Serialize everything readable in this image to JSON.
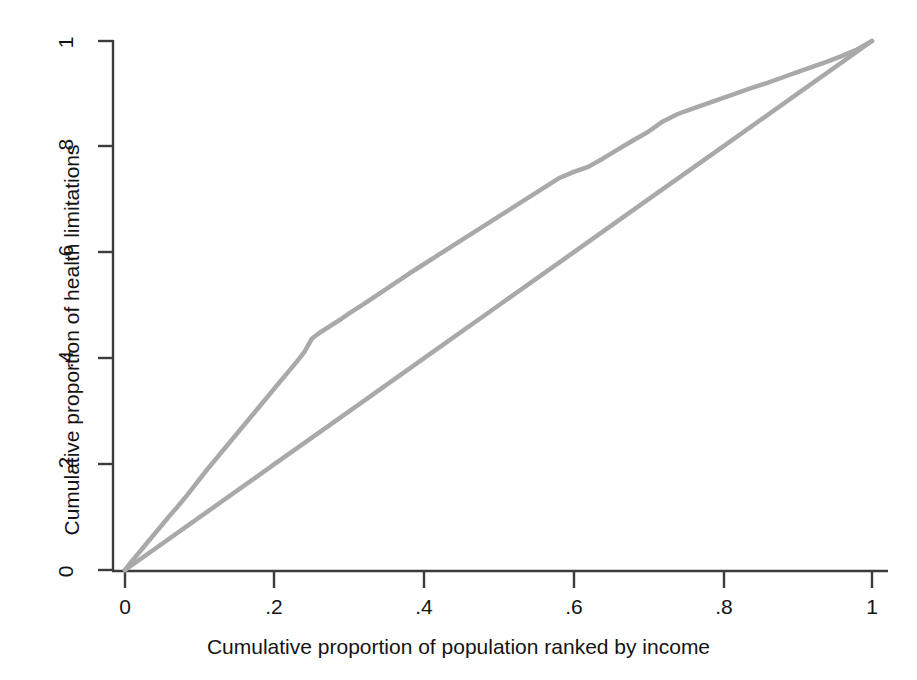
{
  "chart_data": {
    "type": "line",
    "title": "",
    "subtitle": "",
    "xlabel": "Cumulative proportion of population ranked by income",
    "ylabel": "Cumulative proportion of health limitations",
    "xlim": [
      0,
      1
    ],
    "ylim": [
      0,
      1
    ],
    "grid": false,
    "legend": "none",
    "xticks": [
      "0",
      ".2",
      ".4",
      ".6",
      ".8",
      "1"
    ],
    "xtick_values": [
      0,
      0.2,
      0.4,
      0.6,
      0.8,
      1
    ],
    "yticks": [
      "0",
      ".2",
      ".4",
      ".6",
      ".8",
      "1"
    ],
    "ytick_values": [
      0,
      0.2,
      0.4,
      0.6,
      0.8,
      1
    ],
    "line_color": "#a9a9a9",
    "axis_color": "#3c3c3c",
    "background": "#ffffff",
    "series": [
      {
        "name": "concentration-curve",
        "color": "#a9a9a9",
        "x": [
          0.0,
          0.01,
          0.02,
          0.03,
          0.04,
          0.05,
          0.06,
          0.07,
          0.08,
          0.09,
          0.1,
          0.11,
          0.12,
          0.13,
          0.14,
          0.15,
          0.16,
          0.17,
          0.18,
          0.19,
          0.2,
          0.21,
          0.22,
          0.23,
          0.24,
          0.25,
          0.26,
          0.27,
          0.28,
          0.29,
          0.3,
          0.32,
          0.34,
          0.36,
          0.38,
          0.4,
          0.42,
          0.44,
          0.46,
          0.48,
          0.5,
          0.52,
          0.54,
          0.56,
          0.58,
          0.6,
          0.62,
          0.64,
          0.66,
          0.68,
          0.7,
          0.72,
          0.74,
          0.76,
          0.78,
          0.8,
          0.82,
          0.84,
          0.86,
          0.88,
          0.9,
          0.92,
          0.94,
          0.96,
          0.98,
          1.0
        ],
        "y": [
          0.0,
          0.018,
          0.035,
          0.052,
          0.069,
          0.086,
          0.103,
          0.119,
          0.136,
          0.154,
          0.172,
          0.19,
          0.207,
          0.224,
          0.241,
          0.258,
          0.275,
          0.292,
          0.309,
          0.326,
          0.343,
          0.36,
          0.377,
          0.394,
          0.412,
          0.437,
          0.448,
          0.457,
          0.466,
          0.475,
          0.485,
          0.503,
          0.522,
          0.541,
          0.56,
          0.578,
          0.596,
          0.614,
          0.632,
          0.65,
          0.668,
          0.686,
          0.704,
          0.722,
          0.74,
          0.752,
          0.762,
          0.778,
          0.795,
          0.812,
          0.828,
          0.848,
          0.862,
          0.872,
          0.882,
          0.892,
          0.902,
          0.912,
          0.921,
          0.931,
          0.941,
          0.951,
          0.961,
          0.972,
          0.984,
          1.0
        ]
      },
      {
        "name": "line-of-equality",
        "color": "#a9a9a9",
        "x": [
          0.0,
          0.1,
          0.2,
          0.3,
          0.4,
          0.5,
          0.6,
          0.7,
          0.8,
          0.9,
          1.0
        ],
        "y": [
          0.0,
          0.1,
          0.2,
          0.3,
          0.4,
          0.5,
          0.6,
          0.7,
          0.8,
          0.9,
          1.0
        ]
      }
    ]
  },
  "axes": {
    "x_title": "Cumulative proportion of population ranked by income",
    "y_title": "Cumulative proportion of health limitations",
    "x_tick_labels": [
      "0",
      ".2",
      ".4",
      ".6",
      ".8",
      "1"
    ],
    "y_tick_labels": [
      "0",
      ".2",
      ".4",
      ".6",
      ".8",
      "1"
    ]
  }
}
